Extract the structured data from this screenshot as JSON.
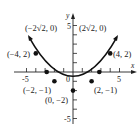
{
  "figure": {
    "axes": {
      "x_label": "x",
      "y_label": "y",
      "x_tick_labels": [
        {
          "value": -5,
          "text": "-5"
        },
        {
          "value": 0,
          "text": "0"
        },
        {
          "value": 5,
          "text": "5"
        }
      ],
      "y_tick_labels": [
        {
          "value": 5,
          "text": "5"
        },
        {
          "value": -5,
          "text": "-5"
        }
      ],
      "xlim": [
        -6,
        6
      ],
      "ylim": [
        -6,
        6
      ]
    },
    "points": [
      {
        "x": -4,
        "y": 2,
        "label": "(−4, 2)"
      },
      {
        "x": -2.828,
        "y": 0,
        "label": "(−2√2, 0)"
      },
      {
        "x": -2,
        "y": -1,
        "label": "(−2, −1)"
      },
      {
        "x": 0,
        "y": -2,
        "label": "(0, −2)"
      },
      {
        "x": 2,
        "y": -1,
        "label": "(2, −1)"
      },
      {
        "x": 2.828,
        "y": 0,
        "label": "(2√2, 0)"
      },
      {
        "x": 4,
        "y": 2,
        "label": "(4, 2)"
      }
    ],
    "curve": "y = x^2/4 - 2",
    "colors": {
      "curve": "#111111",
      "axis": "#222222",
      "point": "#111111"
    }
  }
}
